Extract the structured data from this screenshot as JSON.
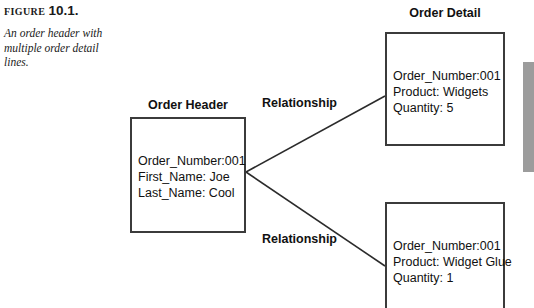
{
  "figure": {
    "label_prefix": "FIGURE",
    "label_number": "10.1.",
    "caption": "An order header with multiple order detail lines."
  },
  "diagram": {
    "entities": [
      {
        "id": "order-header",
        "title": "Order Header",
        "lines": [
          "Order_Number:001",
          "First_Name: Joe",
          "Last_Name: Cool"
        ]
      },
      {
        "id": "order-detail-1",
        "title": "Order Detail",
        "lines": [
          "Order_Number:001",
          "Product: Widgets",
          "Quantity: 5"
        ]
      },
      {
        "id": "order-detail-2",
        "title": "",
        "lines": [
          "Order_Number:001",
          "Product: Widget Glue",
          "Quantity: 1"
        ]
      }
    ],
    "relationships": [
      {
        "label": "Relationship"
      },
      {
        "label": "Relationship"
      }
    ]
  },
  "colors": {
    "box_border": "#3b3b3b",
    "text": "#111111",
    "gray_bar": "#9c9c9c",
    "line": "#2b2b2b"
  }
}
